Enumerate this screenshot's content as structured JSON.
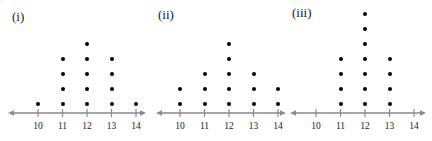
{
  "figure": {
    "title": "",
    "dot_plot_count": 3
  },
  "chart_data": {
    "type": "bar",
    "title": "",
    "xlabel": "",
    "ylabel": "",
    "subtitle": "",
    "grid": false,
    "legend": "none",
    "categories": [
      "10",
      "11",
      "12",
      "13",
      "14"
    ],
    "xlim": [
      9.5,
      14.5
    ],
    "ylim": [
      0,
      7
    ],
    "note": "Three dot plots; each dot represents one observation stacked above its value.",
    "plots": [
      {
        "label": "(i)",
        "categories": [
          "10",
          "11",
          "12",
          "13",
          "14"
        ],
        "values": [
          1,
          4,
          5,
          4,
          1
        ],
        "total": 15
      },
      {
        "label": "(ii)",
        "categories": [
          "10",
          "11",
          "12",
          "13",
          "14"
        ],
        "values": [
          2,
          3,
          5,
          3,
          2
        ],
        "total": 15
      },
      {
        "label": "(iii)",
        "categories": [
          "10",
          "11",
          "12",
          "13",
          "14"
        ],
        "values": [
          0,
          4,
          7,
          4,
          0
        ],
        "total": 15
      }
    ]
  },
  "style": {
    "dot_color": "#000000",
    "axis_color": "#8a8a8a",
    "text_color": "#1a1a1a",
    "background": "#ffffff"
  },
  "layout": {
    "plots": [
      {
        "left": 0,
        "width": 150,
        "label_left": 12,
        "label_top": 10,
        "axis_y": 113,
        "axis_x_start": 8,
        "axis_x_end": 146,
        "first_tick_x": 38,
        "tick_gap": 24.5
      },
      {
        "left": 148,
        "width": 140,
        "label_left": 10,
        "label_top": 8,
        "axis_y": 113,
        "axis_x_start": 8,
        "axis_x_end": 138,
        "first_tick_x": 32,
        "tick_gap": 24.5
      },
      {
        "left": 286,
        "width": 146,
        "label_left": 6,
        "label_top": 6,
        "axis_y": 113,
        "axis_x_start": 4,
        "axis_x_end": 140,
        "first_tick_x": 30,
        "tick_gap": 24.5
      }
    ],
    "dot_spacing_y": 15,
    "first_dot_offset_y": 9
  }
}
